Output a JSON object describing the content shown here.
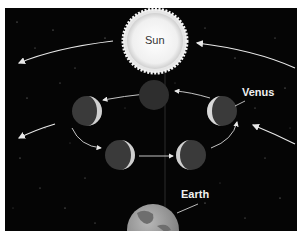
{
  "diagram": {
    "labels": {
      "sun": "Sun",
      "venus": "Venus",
      "earth": "Earth"
    },
    "colors": {
      "background": "#050505",
      "sun": "#f2f2f2",
      "venus_dark": "#3a3a3a",
      "venus_lit": "#d8d8d8",
      "earth": "#9a9a9a",
      "arrows": "#e8e8e8"
    },
    "venus_positions": [
      {
        "id": "top",
        "phase": "new"
      },
      {
        "id": "upper-right",
        "phase": "crescent-lit-left"
      },
      {
        "id": "upper-left",
        "phase": "crescent-lit-right"
      },
      {
        "id": "lower-left",
        "phase": "crescent-lit-right"
      },
      {
        "id": "lower-right",
        "phase": "crescent-lit-left"
      }
    ]
  }
}
